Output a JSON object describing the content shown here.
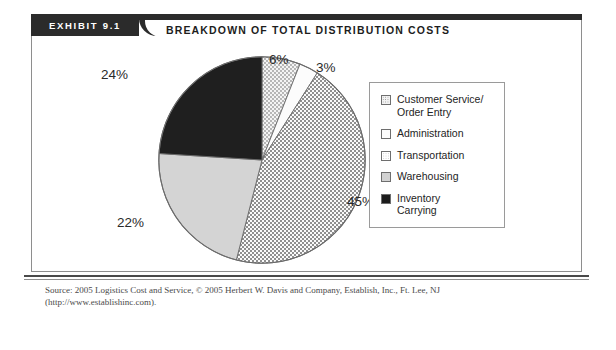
{
  "exhibit": {
    "tab_label": "EXHIBIT  9.1",
    "title": "BREAKDOWN OF TOTAL DISTRIBUTION COSTS",
    "source_note": "Source: 2005 Logistics Cost and Service, © 2005 Herbert W. Davis and Company, Establish, Inc., Ft. Lee, NJ (http://www.establishinc.com)."
  },
  "legend": {
    "items": [
      {
        "label": "Customer Service/\nOrder Entry",
        "pattern": "dotted",
        "color": "#f2f2f2"
      },
      {
        "label": "Administration",
        "pattern": "plain",
        "color": "#fdfdfd"
      },
      {
        "label": "Transportation",
        "pattern": "checkered",
        "color": "#8d8d8d"
      },
      {
        "label": "Warehousing",
        "pattern": "solid-light-gray",
        "color": "#d2d2d2"
      },
      {
        "label": "Inventory\nCarrying",
        "pattern": "solid-black",
        "color": "#1c1c1c"
      }
    ]
  },
  "labels": {
    "customer_service": "6%",
    "administration": "3%",
    "transportation": "45%",
    "warehousing": "22%",
    "inventory_carrying": "24%"
  },
  "chart_data": {
    "type": "pie",
    "title": "BREAKDOWN OF TOTAL DISTRIBUTION COSTS",
    "categories": [
      "Customer Service/Order Entry",
      "Administration",
      "Transportation",
      "Warehousing",
      "Inventory Carrying"
    ],
    "values": [
      6,
      3,
      45,
      22,
      24
    ],
    "unit": "percent",
    "data_labels": [
      "6%",
      "3%",
      "45%",
      "22%",
      "24%"
    ],
    "start_angle_deg": 0,
    "direction": "clockwise",
    "legend_position": "right",
    "grid": false,
    "slice_styles": [
      "dotted",
      "plain",
      "checkered",
      "solid-light-gray",
      "solid-black"
    ]
  }
}
